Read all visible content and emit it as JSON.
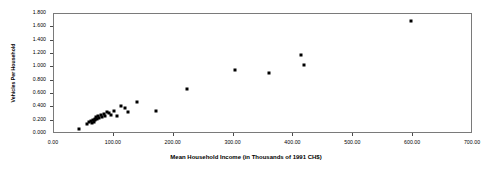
{
  "chart_data": {
    "type": "scatter",
    "title": "",
    "xlabel": "Mean Household Income (in Thousands of 1991 CH$)",
    "ylabel": "Vehicles Per Household",
    "xlim": [
      0,
      700
    ],
    "ylim": [
      0.0,
      1.8
    ],
    "grid": false,
    "legend": null,
    "marker": "filled-square",
    "marker_color": "#000000",
    "xticks": [
      0,
      100,
      200,
      300,
      400,
      500,
      600,
      700
    ],
    "xtick_labels": [
      "0.00",
      "100.00",
      "200.00",
      "300.00",
      "400.00",
      "500.00",
      "600.00",
      "700.00"
    ],
    "yticks": [
      0.0,
      0.2,
      0.4,
      0.6,
      0.8,
      1.0,
      1.2,
      1.4,
      1.6,
      1.8
    ],
    "ytick_labels": [
      "0.000",
      "0.200",
      "0.400",
      "0.600",
      "0.800",
      "1.000",
      "1.200",
      "1.400",
      "1.600",
      "1.800"
    ],
    "points": [
      {
        "x": 41,
        "y": 0.075
      },
      {
        "x": 55,
        "y": 0.15
      },
      {
        "x": 58,
        "y": 0.175
      },
      {
        "x": 61,
        "y": 0.195
      },
      {
        "x": 63,
        "y": 0.165
      },
      {
        "x": 65,
        "y": 0.215
      },
      {
        "x": 66,
        "y": 0.185
      },
      {
        "x": 68,
        "y": 0.23
      },
      {
        "x": 69,
        "y": 0.205
      },
      {
        "x": 71,
        "y": 0.255
      },
      {
        "x": 72,
        "y": 0.225
      },
      {
        "x": 74,
        "y": 0.265
      },
      {
        "x": 76,
        "y": 0.245
      },
      {
        "x": 78,
        "y": 0.285
      },
      {
        "x": 80,
        "y": 0.26
      },
      {
        "x": 83,
        "y": 0.3
      },
      {
        "x": 86,
        "y": 0.275
      },
      {
        "x": 88,
        "y": 0.33
      },
      {
        "x": 92,
        "y": 0.31
      },
      {
        "x": 96,
        "y": 0.29
      },
      {
        "x": 101,
        "y": 0.35
      },
      {
        "x": 106,
        "y": 0.265
      },
      {
        "x": 112,
        "y": 0.415
      },
      {
        "x": 118,
        "y": 0.395
      },
      {
        "x": 124,
        "y": 0.33
      },
      {
        "x": 138,
        "y": 0.48
      },
      {
        "x": 170,
        "y": 0.34
      },
      {
        "x": 223,
        "y": 0.675
      },
      {
        "x": 302,
        "y": 0.965
      },
      {
        "x": 360,
        "y": 0.92
      },
      {
        "x": 413,
        "y": 1.185
      },
      {
        "x": 418,
        "y": 1.03
      },
      {
        "x": 596,
        "y": 1.69
      }
    ]
  }
}
